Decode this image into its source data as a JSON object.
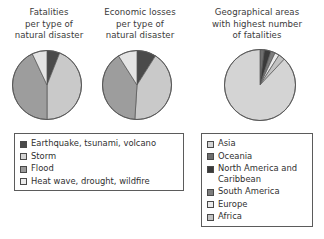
{
  "figure": {
    "background_color": "#ffffff",
    "charts": [
      {
        "id": "fatalities",
        "title": "Fatalities\nper type of\nnatural disaster"
      },
      {
        "id": "economic",
        "title": "Economic losses\nper type of\nnatural disaster"
      },
      {
        "id": "geographic",
        "title": "Geographical areas\nwith highest number\nof fatalities"
      }
    ]
  },
  "legends": {
    "disasters": {
      "name": "disaster-type-legend",
      "items": [
        {
          "label": "Earthquake, tsunami, volcano",
          "color": "#4a4a4a"
        },
        {
          "label": "Storm",
          "color": "#d4d4d4"
        },
        {
          "label": "Flood",
          "color": "#9a9a9a"
        },
        {
          "label": "Heat wave, drought, wildfire",
          "color": "#ebebeb"
        }
      ]
    },
    "regions": {
      "name": "region-legend",
      "items": [
        {
          "label": "Asia",
          "color": "#d4d4d4"
        },
        {
          "label": "Oceania",
          "color": "#6e6e6e"
        },
        {
          "label": "North America and\nCaribbean",
          "color": "#3a3a3a"
        },
        {
          "label": "South America",
          "color": "#7d7d7d"
        },
        {
          "label": "Europe",
          "color": "#ebebeb"
        },
        {
          "label": "Africa",
          "color": "#c2c2c2"
        }
      ]
    }
  },
  "chart_data": [
    {
      "type": "pie",
      "id": "fatalities",
      "title": "Fatalities per type of natural disaster",
      "start_angle_deg": 0,
      "direction": "clockwise",
      "categories": [
        "Earthquake, tsunami, volcano",
        "Storm",
        "Flood",
        "Heat wave, drought, wildfire"
      ],
      "values": [
        6,
        44,
        43,
        7
      ],
      "colors": [
        "#4a4a4a",
        "#c9c9c9",
        "#9d9d9d",
        "#e4e4e4"
      ],
      "slice_order": [
        {
          "label": "Earthquake, tsunami, volcano",
          "percent": 6,
          "color": "#4a4a4a"
        },
        {
          "label": "Storm",
          "percent": 44,
          "color": "#c9c9c9"
        },
        {
          "label": "Flood",
          "percent": 43,
          "color": "#9d9d9d"
        },
        {
          "label": "Heat wave, drought, wildfire",
          "percent": 7,
          "color": "#e4e4e4"
        }
      ]
    },
    {
      "type": "pie",
      "id": "economic",
      "title": "Economic losses per type of natural disaster",
      "start_angle_deg": 0,
      "direction": "clockwise",
      "categories": [
        "Earthquake, tsunami, volcano",
        "Storm",
        "Flood",
        "Heat wave, drought, wildfire"
      ],
      "values": [
        9,
        42,
        40,
        9
      ],
      "colors": [
        "#4a4a4a",
        "#c9c9c9",
        "#9d9d9d",
        "#e4e4e4"
      ],
      "slice_order": [
        {
          "label": "Earthquake, tsunami, volcano",
          "percent": 9,
          "color": "#4a4a4a"
        },
        {
          "label": "Storm",
          "percent": 42,
          "color": "#c9c9c9"
        },
        {
          "label": "Flood",
          "percent": 40,
          "color": "#9d9d9d"
        },
        {
          "label": "Heat wave, drought, wildfire",
          "percent": 9,
          "color": "#e4e4e4"
        }
      ]
    },
    {
      "type": "pie",
      "id": "geographic",
      "title": "Geographical areas with highest number of fatalities",
      "start_angle_deg": 0,
      "direction": "clockwise",
      "categories": [
        "Asia",
        "Oceania",
        "North America and Caribbean",
        "South America",
        "Europe",
        "Africa"
      ],
      "values": [
        88,
        2,
        3,
        2,
        2,
        3
      ],
      "colors": [
        "#d4d4d4",
        "#6e6e6e",
        "#3a3a3a",
        "#7d7d7d",
        "#ebebeb",
        "#c2c2c2"
      ],
      "slice_order": [
        {
          "label": "Oceania",
          "percent": 2,
          "color": "#6e6e6e"
        },
        {
          "label": "North America and Caribbean",
          "percent": 3,
          "color": "#3a3a3a"
        },
        {
          "label": "South America",
          "percent": 2,
          "color": "#7d7d7d"
        },
        {
          "label": "Europe",
          "percent": 2,
          "color": "#ebebeb"
        },
        {
          "label": "Africa",
          "percent": 3,
          "color": "#c2c2c2"
        },
        {
          "label": "Asia",
          "percent": 88,
          "color": "#d4d4d4"
        }
      ]
    }
  ]
}
